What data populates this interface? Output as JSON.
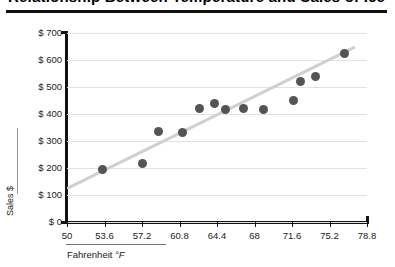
{
  "chart_data": {
    "type": "scatter",
    "title": "Relationship Between Temperature and Sales of Ice Cream",
    "xlabel": "Fahrenheit",
    "xlabel_unit": "°F",
    "ylabel": "Sales $",
    "xlim": [
      50,
      78.8
    ],
    "ylim": [
      0,
      700
    ],
    "xticks": [
      "50",
      "53.6",
      "57.2",
      "60.8",
      "64.4",
      "68",
      "71.6",
      "75.2",
      "78.8"
    ],
    "xtick_values": [
      50,
      53.6,
      57.2,
      60.8,
      64.4,
      68,
      71.6,
      75.2,
      78.8
    ],
    "yticks": [
      "$ 0",
      "$ 100",
      "$ 200",
      "$ 300",
      "$ 400",
      "$ 500",
      "$ 600",
      "$ 700"
    ],
    "ytick_values": [
      0,
      100,
      200,
      300,
      400,
      500,
      600,
      700
    ],
    "grid": true,
    "legend": false,
    "point_color": "#545454",
    "trendline_color": "#d0d0d0",
    "x": [
      53.4,
      57.2,
      58.8,
      61.1,
      62.7,
      64.2,
      65.2,
      66.9,
      68.9,
      71.7,
      72.4,
      73.9,
      76.6
    ],
    "y": [
      195,
      215,
      335,
      330,
      420,
      440,
      415,
      420,
      415,
      450,
      520,
      540,
      625
    ],
    "points": [
      {
        "x": 53.4,
        "y": 195
      },
      {
        "x": 57.2,
        "y": 215
      },
      {
        "x": 58.8,
        "y": 335
      },
      {
        "x": 61.1,
        "y": 330
      },
      {
        "x": 62.7,
        "y": 420
      },
      {
        "x": 64.2,
        "y": 440
      },
      {
        "x": 65.2,
        "y": 415
      },
      {
        "x": 66.9,
        "y": 420
      },
      {
        "x": 68.9,
        "y": 415
      },
      {
        "x": 71.7,
        "y": 450
      },
      {
        "x": 72.4,
        "y": 520
      },
      {
        "x": 73.9,
        "y": 540
      },
      {
        "x": 76.6,
        "y": 625
      }
    ],
    "trendline": {
      "x0": 50.0,
      "y0": 130,
      "x1": 77.7,
      "y1": 655
    }
  }
}
